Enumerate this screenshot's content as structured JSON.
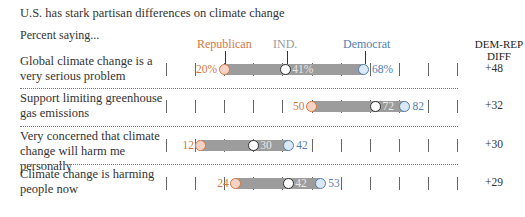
{
  "header": {
    "title": "U.S. has stark partisan differences on climate change",
    "subtitle": "Percent saying..."
  },
  "legend": {
    "republican": "Republican",
    "independent": "IND.",
    "democrat": "Democrat",
    "diff_header_line1": "DEM-REP",
    "diff_header_line2": "DIFF"
  },
  "colors": {
    "republican": "#d4773f",
    "independent": "#333333",
    "democrat": "#4f7fb2",
    "bar": "#9c9c9c"
  },
  "rows": [
    {
      "label": "Global climate change is a very serious problem",
      "rep": "20%",
      "ind": "41%",
      "dem": "68%",
      "diff": "+48"
    },
    {
      "label": "Support limiting greenhouse gas emissions",
      "rep": "50",
      "ind": "72",
      "dem": "82",
      "diff": "+32"
    },
    {
      "label": "Very concerned that climate change will harm me personally",
      "rep": "12",
      "ind": "30",
      "dem": "42",
      "diff": "+30"
    },
    {
      "label": "Climate change is harming people now",
      "rep": "24",
      "ind": "42",
      "dem": "53",
      "diff": "+29"
    }
  ],
  "chart_data": {
    "type": "dot-range",
    "title": "U.S. has stark partisan differences on climate change",
    "subtitle": "Percent saying...",
    "categories": [
      "Global climate change is a very serious problem",
      "Support limiting greenhouse gas emissions",
      "Very concerned that climate change will harm me personally",
      "Climate change is harming people now"
    ],
    "series": [
      {
        "name": "Republican",
        "values": [
          20,
          50,
          12,
          24
        ]
      },
      {
        "name": "IND.",
        "values": [
          41,
          72,
          30,
          42
        ]
      },
      {
        "name": "Democrat",
        "values": [
          68,
          82,
          42,
          53
        ]
      }
    ],
    "diff": {
      "name": "DEM-REP DIFF",
      "values": [
        48,
        32,
        30,
        29
      ]
    },
    "xlim": [
      0,
      100
    ],
    "tick_interval": 10,
    "grid": false,
    "legend_position": "top"
  }
}
